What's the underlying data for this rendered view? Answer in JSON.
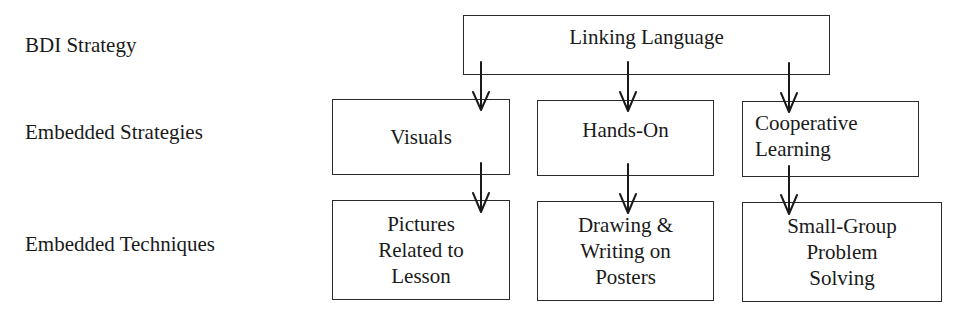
{
  "labels": {
    "bdi_strategy": "BDI Strategy",
    "embedded_strategies": "Embedded Strategies",
    "embedded_techniques": "Embedded Techniques"
  },
  "nodes": {
    "top": {
      "text": "Linking Language"
    },
    "strategies": [
      {
        "text": "Visuals"
      },
      {
        "text": "Hands-On"
      },
      {
        "text": "Cooperative\nLearning"
      }
    ],
    "techniques": [
      {
        "text": "Pictures\nRelated to\nLesson"
      },
      {
        "text": "Drawing &\nWriting on\nPosters"
      },
      {
        "text": "Small-Group\nProblem\nSolving"
      }
    ]
  },
  "edges": [
    {
      "from": "Linking Language",
      "to": "Visuals"
    },
    {
      "from": "Linking Language",
      "to": "Hands-On"
    },
    {
      "from": "Linking Language",
      "to": "Cooperative Learning"
    },
    {
      "from": "Visuals",
      "to": "Pictures Related to Lesson"
    },
    {
      "from": "Hands-On",
      "to": "Drawing & Writing on Posters"
    },
    {
      "from": "Cooperative Learning",
      "to": "Small-Group Problem Solving"
    }
  ],
  "colors": {
    "stroke": "#2a2a2a",
    "text": "#1a1a1a",
    "background": "#ffffff"
  }
}
